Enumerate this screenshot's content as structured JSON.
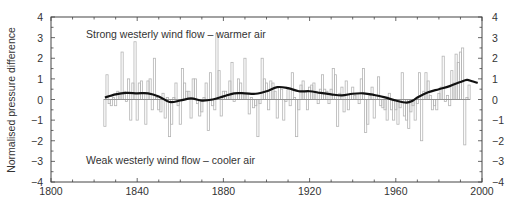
{
  "chart_data": {
    "type": "bar",
    "title": "",
    "xlabel": "",
    "ylabel": "Normalised pressure difference",
    "xlim": [
      1800,
      2000
    ],
    "ylim": [
      -4,
      4
    ],
    "x_ticks": [
      1800,
      1840,
      1880,
      1920,
      1960,
      2000
    ],
    "y_ticks": [
      -4,
      -3,
      -2,
      -1,
      0,
      1,
      2,
      3,
      4
    ],
    "y_ticks_right": [
      -4,
      -3,
      -2,
      -1,
      0,
      1,
      2,
      3,
      4
    ],
    "grid": false,
    "legend": null,
    "annotations": [
      {
        "text": "Strong westerly wind flow – warmer air",
        "x": 1820,
        "y": 3.2
      },
      {
        "text": "Weak westerly wind flow – cooler air",
        "x": 1820,
        "y": -2.95
      }
    ],
    "series": [
      {
        "name": "Annual normalised pressure difference",
        "style": "step-bar",
        "x": [
          1825,
          1826,
          1827,
          1828,
          1829,
          1830,
          1831,
          1832,
          1833,
          1834,
          1835,
          1836,
          1837,
          1838,
          1839,
          1840,
          1841,
          1842,
          1843,
          1844,
          1845,
          1846,
          1847,
          1848,
          1849,
          1850,
          1851,
          1852,
          1853,
          1854,
          1855,
          1856,
          1857,
          1858,
          1859,
          1860,
          1861,
          1862,
          1863,
          1864,
          1865,
          1866,
          1867,
          1868,
          1869,
          1870,
          1871,
          1872,
          1873,
          1874,
          1875,
          1876,
          1877,
          1878,
          1879,
          1880,
          1881,
          1882,
          1883,
          1884,
          1885,
          1886,
          1887,
          1888,
          1889,
          1890,
          1891,
          1892,
          1893,
          1894,
          1895,
          1896,
          1897,
          1898,
          1899,
          1900,
          1901,
          1902,
          1903,
          1904,
          1905,
          1906,
          1907,
          1908,
          1909,
          1910,
          1911,
          1912,
          1913,
          1914,
          1915,
          1916,
          1917,
          1918,
          1919,
          1920,
          1921,
          1922,
          1923,
          1924,
          1925,
          1926,
          1927,
          1928,
          1929,
          1930,
          1931,
          1932,
          1933,
          1934,
          1935,
          1936,
          1937,
          1938,
          1939,
          1940,
          1941,
          1942,
          1943,
          1944,
          1945,
          1946,
          1947,
          1948,
          1949,
          1950,
          1951,
          1952,
          1953,
          1954,
          1955,
          1956,
          1957,
          1958,
          1959,
          1960,
          1961,
          1962,
          1963,
          1964,
          1965,
          1966,
          1967,
          1968,
          1969,
          1970,
          1971,
          1972,
          1973,
          1974,
          1975,
          1976,
          1977,
          1978,
          1979,
          1980,
          1981,
          1982,
          1983,
          1984,
          1985,
          1986,
          1987,
          1988,
          1989,
          1990,
          1991,
          1992,
          1993,
          1994
        ],
        "values": [
          -1.3,
          1.2,
          -0.2,
          -0.3,
          0.1,
          -0.3,
          0.4,
          0.3,
          2.3,
          0.4,
          -0.1,
          1.0,
          -1.0,
          0.8,
          2.8,
          -1.0,
          0.8,
          0.9,
          0.3,
          -1.2,
          0.9,
          1.0,
          -0.5,
          2.0,
          0.1,
          -0.5,
          -0.6,
          0.3,
          -0.9,
          0.1,
          -1.8,
          -1.2,
          0.1,
          0.8,
          -0.3,
          -1.2,
          1.5,
          0.8,
          0.4,
          0.4,
          -0.9,
          1.0,
          1.0,
          -0.2,
          -0.8,
          -0.6,
          0.1,
          0.8,
          -1.5,
          1.3,
          -0.3,
          -0.5,
          3.2,
          1.4,
          -0.8,
          0.4,
          0.4,
          0.2,
          0.9,
          1.8,
          -0.1,
          0.3,
          1.0,
          0.8,
          0.3,
          2.0,
          0.3,
          -0.7,
          0.1,
          -0.4,
          -0.3,
          -1.8,
          -0.2,
          2.0,
          1.0,
          0.8,
          -0.5,
          0.9,
          0.8,
          0.4,
          -0.9,
          0.6,
          0.5,
          -1.0,
          -0.1,
          0.5,
          -0.3,
          1.3,
          0.1,
          -1.8,
          -0.5,
          0.7,
          0.9,
          0.4,
          -0.5,
          0.6,
          0.7,
          0.8,
          0.4,
          -0.2,
          0.5,
          1.2,
          0.5,
          0.4,
          -0.2,
          0.5,
          1.5,
          1.2,
          -1.3,
          0.3,
          0.6,
          -0.6,
          0.9,
          -0.5,
          0.3,
          0.6,
          0.2,
          0.3,
          -0.2,
          1.0,
          1.5,
          -1.6,
          -1.2,
          0.2,
          0.6,
          -0.9,
          0.2,
          1.1,
          -0.3,
          -0.4,
          -0.5,
          -1.0,
          0.3,
          -0.5,
          -1.0,
          -0.5,
          -1.2,
          -0.4,
          1.3,
          -0.8,
          -1.0,
          -1.4,
          -0.6,
          -0.3,
          -1.0,
          -0.2,
          1.3,
          -2.0,
          0.4,
          1.3,
          0.9,
          0.2,
          -0.5,
          -0.3,
          -0.5,
          0.3,
          0.6,
          2.1,
          -0.1,
          0.2,
          -0.3,
          1.4,
          0.8,
          2.2,
          1.8,
          2.3,
          2.5,
          -2.2,
          0.1,
          0.7
        ]
      },
      {
        "name": "Smoothed trend",
        "style": "line",
        "x": [
          1825,
          1830,
          1835,
          1840,
          1845,
          1850,
          1855,
          1860,
          1865,
          1870,
          1875,
          1880,
          1885,
          1890,
          1895,
          1900,
          1905,
          1910,
          1915,
          1920,
          1925,
          1930,
          1935,
          1940,
          1945,
          1950,
          1955,
          1960,
          1965,
          1968,
          1970,
          1975,
          1980,
          1985,
          1990,
          1993,
          1995,
          1998
        ],
        "values": [
          0.1,
          0.25,
          0.32,
          0.3,
          0.3,
          0.15,
          -0.12,
          -0.05,
          0.05,
          -0.05,
          0.0,
          0.15,
          0.3,
          0.3,
          0.28,
          0.4,
          0.6,
          0.55,
          0.4,
          0.4,
          0.32,
          0.25,
          0.2,
          0.28,
          0.3,
          0.22,
          0.1,
          -0.05,
          -0.15,
          -0.05,
          0.1,
          0.35,
          0.5,
          0.65,
          0.85,
          0.95,
          0.9,
          0.8
        ]
      }
    ],
    "zero_line": 0,
    "colors": {
      "bars": "#b5b5b5",
      "trend": "#111111",
      "axis": "#444444",
      "zero_line": "#888888",
      "text": "#333333"
    }
  },
  "labels": {
    "ylabel": "Normalised pressure difference",
    "annotation_top": "Strong westerly wind flow – warmer air",
    "annotation_bottom": "Weak westerly wind flow – cooler air"
  }
}
